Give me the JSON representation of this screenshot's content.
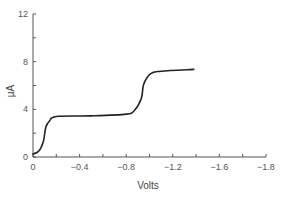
{
  "chart_data": {
    "type": "line",
    "title": "",
    "xlabel": "Volts",
    "ylabel": "µA",
    "xlim": [
      0,
      -2.0
    ],
    "ylim": [
      0,
      12
    ],
    "grid": false,
    "legend": null,
    "x_tick_labels": [
      {
        "label": "0",
        "tick": 0
      },
      {
        "label": "-0.4",
        "tick": 2
      },
      {
        "label": "-0.8",
        "tick": 4
      },
      {
        "label": "-1.2",
        "tick": 6
      },
      {
        "label": "-1.6",
        "tick": 8
      },
      {
        "label": "-1.8",
        "tick": 10
      }
    ],
    "x_tick_count": 11,
    "y_ticks": [
      0,
      2,
      4,
      6,
      8,
      10,
      12
    ],
    "y_tick_labels": [
      "0",
      "4",
      "8",
      "12"
    ],
    "series": [
      {
        "name": "current",
        "color": "#222222",
        "x": [
          0.0,
          -0.05,
          -0.09,
          -0.11,
          -0.14,
          -0.2,
          -0.5,
          -0.8,
          -0.87,
          -0.93,
          -0.95,
          -1.01,
          -1.1,
          -1.38
        ],
        "y": [
          0.25,
          0.5,
          1.35,
          2.5,
          3.0,
          3.4,
          3.45,
          3.6,
          3.9,
          4.9,
          6.1,
          7.0,
          7.2,
          7.35
        ]
      }
    ]
  }
}
